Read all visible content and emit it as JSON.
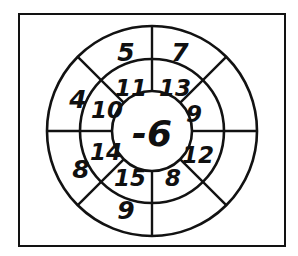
{
  "figure": {
    "kind": "concentric-number-wheel",
    "border_color": "#121212",
    "line_color": "#121212",
    "background_color": "#ffffff",
    "text_color": "#101010"
  },
  "center": {
    "value": "-6"
  },
  "middle_ring": {
    "sector_count": 8,
    "cells": [
      {
        "position": "top-left",
        "value": "11"
      },
      {
        "position": "top-right",
        "value": "13"
      },
      {
        "position": "right-upper",
        "value": "9"
      },
      {
        "position": "right-lower",
        "value": "12"
      },
      {
        "position": "bottom-right",
        "value": "8"
      },
      {
        "position": "bottom-left",
        "value": "15"
      },
      {
        "position": "left-lower",
        "value": "14"
      },
      {
        "position": "left-upper",
        "value": "10"
      }
    ]
  },
  "outer_ring": {
    "sector_count": 8,
    "cells": [
      {
        "position": "top-left",
        "value": "5"
      },
      {
        "position": "top-right",
        "value": "7"
      },
      {
        "position": "right-upper",
        "value": ""
      },
      {
        "position": "right-lower",
        "value": ""
      },
      {
        "position": "bottom-right",
        "value": ""
      },
      {
        "position": "bottom-left",
        "value": "9"
      },
      {
        "position": "left-lower",
        "value": "8"
      },
      {
        "position": "left-upper",
        "value": "4"
      }
    ]
  }
}
